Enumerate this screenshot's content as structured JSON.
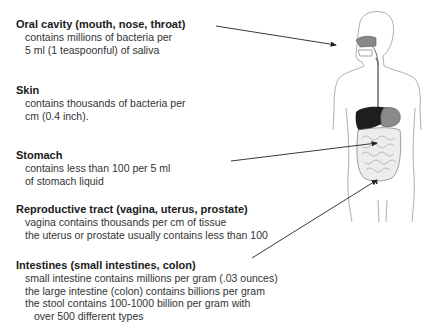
{
  "sections": [
    {
      "heading": "Oral cavity (mouth, nose, throat)",
      "lines": [
        "contains millions of bacteria per",
        "5 ml (1 teaspoonful) of saliva"
      ]
    },
    {
      "heading": "Skin",
      "lines": [
        "contains thousands of bacteria per",
        "cm (0.4 inch)."
      ]
    },
    {
      "heading": "Stomach",
      "lines": [
        "contains less than 100 per 5 ml",
        "of stomach liquid"
      ]
    },
    {
      "heading": "Reproductive tract (vagina, uterus, prostate)",
      "lines": [
        "vagina contains thousands per cm of tissue",
        "the uterus or prostate usually contains less than 100"
      ]
    },
    {
      "heading": "Intestines (small intestines, colon)",
      "lines": [
        "small intestine contains millions per gram (.03 ounces)",
        "the large intestine (colon) contains billions per gram",
        "the stool contains 100-1000 billion per gram with",
        "over 500 different types"
      ]
    }
  ],
  "figure": {
    "label": "human-body-outline-with-digestive-tract",
    "arrows": [
      {
        "from": "oral-cavity",
        "x1": 216,
        "y1": 26,
        "x2": 336,
        "y2": 45
      },
      {
        "from": "stomach",
        "x1": 231,
        "y1": 161,
        "x2": 377,
        "y2": 143
      },
      {
        "from": "intestines",
        "x1": 252,
        "y1": 258,
        "x2": 377,
        "y2": 180
      }
    ]
  }
}
